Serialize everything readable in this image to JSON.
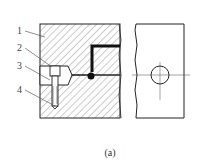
{
  "figure": {
    "caption": "(a)",
    "labels": [
      {
        "id": "1",
        "text": "1"
      },
      {
        "id": "2",
        "text": "2"
      },
      {
        "id": "3",
        "text": "3"
      },
      {
        "id": "4",
        "text": "4"
      }
    ],
    "views": [
      "section-view",
      "side-view"
    ],
    "colors": {
      "line": "#222222",
      "hatch": "#555555",
      "background": "#ffffff"
    }
  }
}
